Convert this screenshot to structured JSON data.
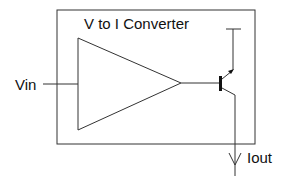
{
  "diagram": {
    "title": "V to I Converter",
    "input_label": "Vin",
    "output_label": "Iout",
    "components": [
      {
        "type": "amplifier",
        "shape": "triangle"
      },
      {
        "type": "transistor",
        "kind": "bipolar"
      }
    ],
    "colors": {
      "line": "#222222",
      "background": "#ffffff"
    }
  }
}
